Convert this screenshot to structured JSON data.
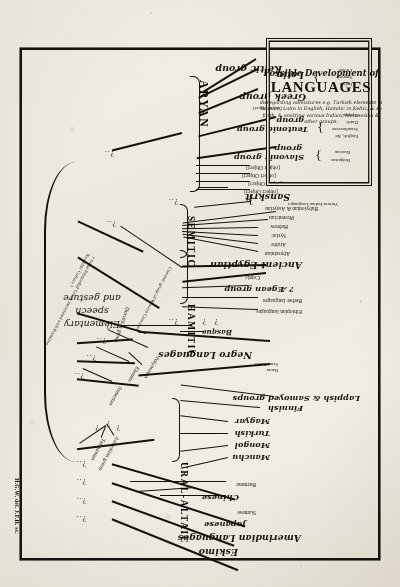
{
  "plate": {
    "signature": "H.G.W. del. J.F.H. sc.",
    "root_label_line1": "Elementary speech",
    "root_label_line2": "and gesture"
  },
  "cartouche": {
    "title_small": "Possible Development of",
    "title_large": "LANGUAGES",
    "note": "disregarding admixtures e.g. Turkish elements in Russian, Latin in English, Hamitic in Keltic, & so forth, & omitting various Indian, Melanesian & other groups."
  },
  "families": {
    "aryan": "ARYAN",
    "semitic": "SEMITIC",
    "hamitic": "HAMITIC",
    "ural_altaic": "URAL-ALTAIC"
  },
  "aryan_branches": [
    {
      "label": "Keltic group"
    },
    {
      "label": "Latin",
      "children": [
        "French",
        "Spanish",
        "Italian"
      ]
    },
    {
      "label": "Greek group"
    },
    {
      "label": "Albanian"
    },
    {
      "label": "Teutonic group",
      "children": [
        "German",
        "Dutch",
        "Scandinavian",
        "English, &c"
      ]
    },
    {
      "label": "Slavonic group",
      "children": [
        "Russian",
        "Bulgarian"
      ]
    },
    {
      "label": "Lithuanian"
    },
    {
      "label": "Tokhari"
    },
    {
      "label": "Armenian"
    },
    {
      "label": "Persian"
    },
    {
      "label": "Sanskrit",
      "children": [
        "Various Indian Languages"
      ]
    }
  ],
  "semitic_branches": [
    "Babylonian & Assyrian",
    "Phoenician",
    "Hebrew",
    "Syriac",
    "Arabic",
    "Abyssinian"
  ],
  "hamitic_branches": [
    "Ancient Egyptian",
    "Coptic",
    "? Ægean group",
    "Berber languages",
    "Ethiopian languages"
  ],
  "ural_altaic_branches": [
    "Lappish & Samoyed groups",
    "Finnish",
    "Magyar",
    "Turkish",
    "Mongol",
    "Manchu"
  ],
  "isolated_top": [
    "Burmese",
    "Chinese",
    "Siamese",
    "Japanese",
    "Amerindian Languages",
    "Eskimo"
  ],
  "other_groups": [
    "Negro Languages",
    "Bantu",
    "Semi-Bantu",
    "Basque",
    "Caucasic group of Western Caucasus",
    "Dravidian group",
    "Polynesian",
    "Elamite",
    "Sumerian",
    "Australian group",
    "Tasmanian"
  ],
  "annotations": {
    "primordial": "? Some Primordial Group associated with Primitive Neolithic Culture ?"
  },
  "marks": {
    "query": "?",
    "node": "?..",
    "brace_left": "{",
    "brace_right": "}"
  }
}
